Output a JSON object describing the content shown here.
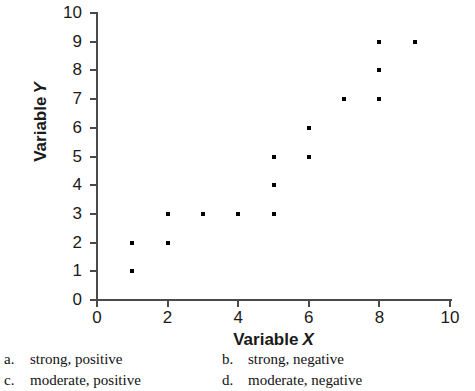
{
  "chart_data": {
    "type": "scatter",
    "title": "",
    "xlabel": "Variable X",
    "ylabel": "Variable Y",
    "xlim": [
      0,
      10
    ],
    "ylim": [
      0,
      10
    ],
    "grid": false,
    "legend": null,
    "x_ticks": [
      0,
      2,
      4,
      6,
      8,
      10
    ],
    "y_ticks": [
      0,
      1,
      2,
      3,
      4,
      5,
      6,
      7,
      8,
      9,
      10
    ],
    "x_tick_labels": [
      "0",
      "2",
      "4",
      "6",
      "8",
      "10"
    ],
    "y_tick_labels": [
      "0",
      "1",
      "2",
      "3",
      "4",
      "5",
      "6",
      "7",
      "8",
      "9",
      "10"
    ],
    "marker": "square",
    "marker_color": "#000000",
    "points": [
      {
        "x": 1,
        "y": 1
      },
      {
        "x": 1,
        "y": 2
      },
      {
        "x": 2,
        "y": 2
      },
      {
        "x": 2,
        "y": 3
      },
      {
        "x": 3,
        "y": 3
      },
      {
        "x": 4,
        "y": 3
      },
      {
        "x": 5,
        "y": 3
      },
      {
        "x": 5,
        "y": 4
      },
      {
        "x": 5,
        "y": 5
      },
      {
        "x": 6,
        "y": 5
      },
      {
        "x": 6,
        "y": 6
      },
      {
        "x": 7,
        "y": 7
      },
      {
        "x": 8,
        "y": 7
      },
      {
        "x": 8,
        "y": 8
      },
      {
        "x": 8,
        "y": 9
      },
      {
        "x": 9,
        "y": 9
      }
    ]
  },
  "axis_titles": {
    "x_word": "Variable",
    "x_letter": "X",
    "y_word": "Variable",
    "y_letter": "Y"
  },
  "answers": {
    "options": [
      {
        "key": "a.",
        "text": "strong, positive"
      },
      {
        "key": "b.",
        "text": "strong, negative"
      },
      {
        "key": "c.",
        "text": "moderate, positive"
      },
      {
        "key": "d.",
        "text": "moderate, negative"
      }
    ]
  },
  "colors": {
    "axis": "#4a4a4a",
    "marker": "#000000",
    "text": "#1a1a1a",
    "background": "#ffffff"
  }
}
